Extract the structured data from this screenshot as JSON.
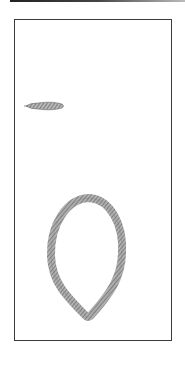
{
  "plate": {
    "figures": [
      {
        "id": "fragment",
        "description": "small elongated braided fragment"
      },
      {
        "id": "loop",
        "description": "teardrop-shaped braided loop"
      }
    ],
    "colors": {
      "frame": "#3a3a3a",
      "strand": "#8a8a8a",
      "strand_dark": "#5a5a5a"
    }
  }
}
